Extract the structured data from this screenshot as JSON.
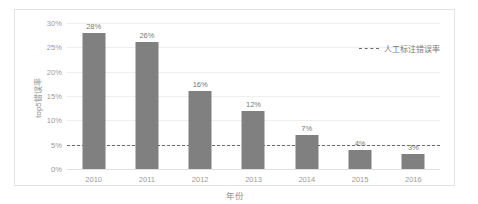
{
  "chart_data": {
    "type": "bar",
    "title": "",
    "categories": [
      "2010",
      "2011",
      "2012",
      "2013",
      "2014",
      "2015",
      "2016"
    ],
    "values": [
      28,
      26,
      16,
      12,
      7,
      4,
      3
    ],
    "value_labels": [
      "28%",
      "26%",
      "16%",
      "12%",
      "7%",
      "4%",
      "3%"
    ],
    "xlabel": "年份",
    "ylabel": "top5错误率",
    "ylim": [
      0,
      30
    ],
    "yticks": [
      0,
      5,
      10,
      15,
      20,
      25,
      30
    ],
    "ytick_labels": [
      "0%",
      "5%",
      "10%",
      "15%",
      "20%",
      "25%",
      "30%"
    ],
    "grid": true,
    "legend_position": "top-right",
    "series_color": "#808080",
    "reference_line": {
      "value": 5,
      "label": "人工标注错误率",
      "style": "dashed",
      "color": "#6b6b6b"
    }
  }
}
